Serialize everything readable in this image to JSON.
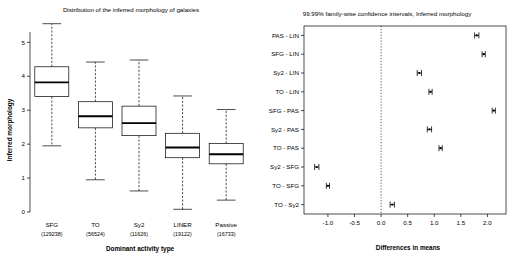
{
  "chart_data": [
    {
      "type": "box",
      "title": "Distribution of the inferred morphology of galaxies",
      "xlabel": "Dominant activity type",
      "ylabel": "Inferred morphology",
      "ylim": [
        0,
        5.6
      ],
      "yticks": [
        "0",
        "1",
        "2",
        "3",
        "4",
        "5"
      ],
      "categories": [
        "SFG",
        "TO",
        "Sy2",
        "LINER",
        "Passive"
      ],
      "counts": [
        "(129238)",
        "(56524)",
        "(11626)",
        "(19122)",
        "(16733)"
      ],
      "boxes": [
        {
          "name": "SFG",
          "lower_whisker": 1.95,
          "q1": 3.4,
          "median": 3.82,
          "q3": 4.28,
          "upper_whisker": 5.55
        },
        {
          "name": "TO",
          "lower_whisker": 0.95,
          "q1": 2.48,
          "median": 2.82,
          "q3": 3.25,
          "upper_whisker": 4.42
        },
        {
          "name": "Sy2",
          "lower_whisker": 0.62,
          "q1": 2.25,
          "median": 2.62,
          "q3": 3.12,
          "upper_whisker": 4.48
        },
        {
          "name": "LINER",
          "lower_whisker": 0.08,
          "q1": 1.6,
          "median": 1.9,
          "q3": 2.32,
          "upper_whisker": 3.42
        },
        {
          "name": "Passive",
          "lower_whisker": 0.35,
          "q1": 1.42,
          "median": 1.7,
          "q3": 2.02,
          "upper_whisker": 3.02
        }
      ]
    },
    {
      "type": "scatter",
      "title": "99.99% family-wise confidence intervals, Inferred morphology",
      "xlabel": "Differences in means",
      "ylabel": "",
      "xlim": [
        -1.45,
        2.35
      ],
      "xticks": [
        "-1.0",
        "-0.5",
        "0.0",
        "0.5",
        "1.0",
        "1.5",
        "2.0"
      ],
      "reference_line": 0.0,
      "comparisons": [
        {
          "label": "PAS - LIN",
          "center": 1.8,
          "low": 1.76,
          "high": 1.84
        },
        {
          "label": "SFG - LIN",
          "center": 1.93,
          "low": 1.9,
          "high": 1.96
        },
        {
          "label": "Sy2 - LIN",
          "center": 0.72,
          "low": 0.68,
          "high": 0.76
        },
        {
          "label": "TO - LIN",
          "center": 0.93,
          "low": 0.9,
          "high": 0.96
        },
        {
          "label": "SFG - PAS",
          "center": 2.12,
          "low": 2.09,
          "high": 2.15
        },
        {
          "label": "Sy2 - PAS",
          "center": 0.91,
          "low": 0.87,
          "high": 0.95
        },
        {
          "label": "TO - PAS",
          "center": 1.12,
          "low": 1.09,
          "high": 1.15
        },
        {
          "label": "Sy2 - SFG",
          "center": -1.21,
          "low": -1.25,
          "high": -1.17
        },
        {
          "label": "TO - SFG",
          "center": -1.0,
          "low": -1.03,
          "high": -0.97
        },
        {
          "label": "TO - Sy2",
          "center": 0.21,
          "low": 0.17,
          "high": 0.25
        }
      ]
    }
  ]
}
